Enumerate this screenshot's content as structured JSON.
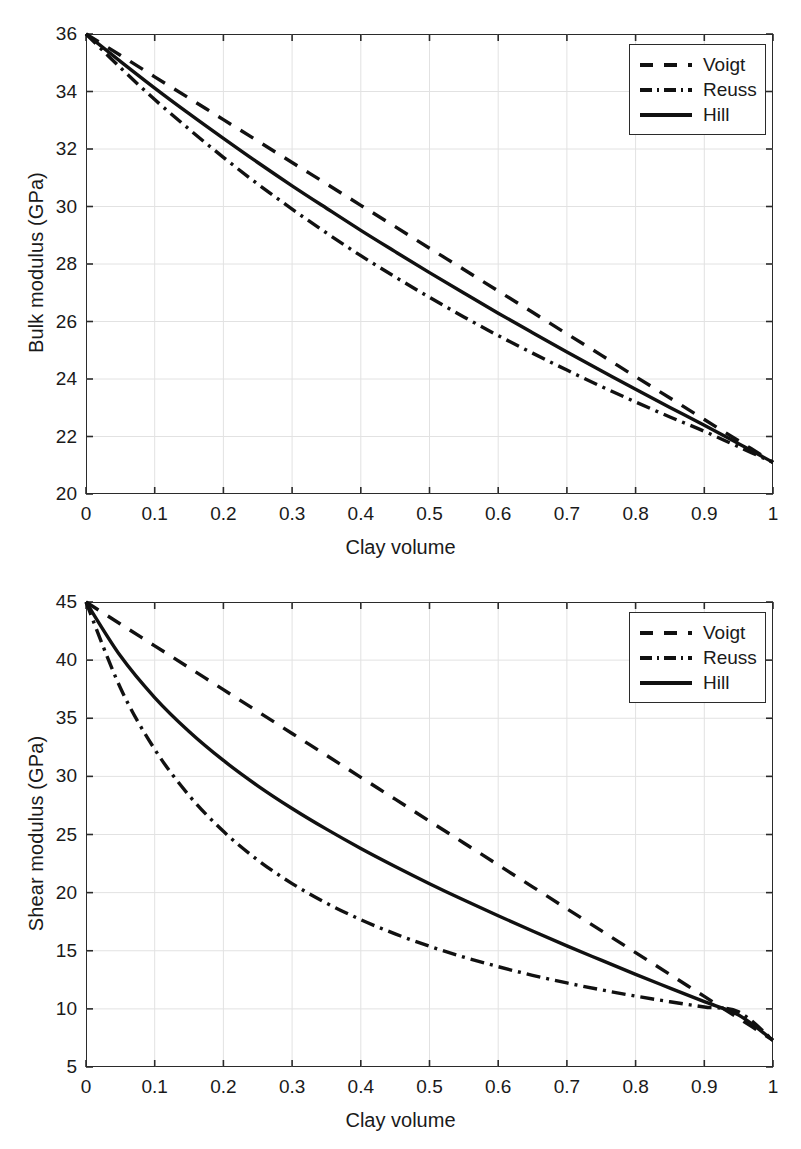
{
  "figure": {
    "width": 801,
    "height": 1149,
    "background": "#ffffff",
    "line_color": "#111111",
    "grid_color": "#e2e2e2",
    "axis_color": "#2b2b2b"
  },
  "chart_data": [
    {
      "type": "line",
      "id": "bulk-modulus-vs-clay-volume",
      "title": "",
      "xlabel": "Clay volume",
      "ylabel": "Bulk modulus (GPa)",
      "xlim": [
        0,
        1
      ],
      "ylim": [
        20,
        36
      ],
      "xticks": [
        0,
        0.1,
        0.2,
        0.3,
        0.4,
        0.5,
        0.6,
        0.7,
        0.8,
        0.9,
        1
      ],
      "xticklabels": [
        "0",
        "0.1",
        "0.2",
        "0.3",
        "0.4",
        "0.5",
        "0.6",
        "0.7",
        "0.8",
        "0.9",
        "1"
      ],
      "yticks": [
        20,
        22,
        24,
        26,
        28,
        30,
        32,
        34,
        36
      ],
      "yticklabels": [
        "20",
        "22",
        "24",
        "26",
        "28",
        "30",
        "32",
        "34",
        "36"
      ],
      "grid": true,
      "legend_position": "top-right",
      "endpoint_values": {
        "clay_volume_0": 36.0,
        "clay_volume_1": 21.1
      },
      "x": [
        0,
        0.05,
        0.1,
        0.15,
        0.2,
        0.25,
        0.3,
        0.35,
        0.4,
        0.45,
        0.5,
        0.55,
        0.6,
        0.65,
        0.7,
        0.75,
        0.8,
        0.85,
        0.9,
        0.95,
        1
      ],
      "series": [
        {
          "name": "Voigt",
          "style": "dashed",
          "values": [
            36.0,
            35.26,
            34.51,
            33.77,
            33.02,
            32.28,
            31.53,
            30.79,
            30.04,
            29.3,
            28.55,
            27.81,
            27.06,
            26.32,
            25.57,
            24.83,
            24.08,
            23.34,
            22.59,
            21.85,
            21.1
          ]
        },
        {
          "name": "Reuss",
          "style": "dash-dot",
          "values": [
            36.0,
            34.83,
            33.72,
            32.69,
            31.71,
            30.78,
            29.91,
            29.08,
            28.29,
            27.55,
            26.84,
            26.16,
            25.51,
            24.9,
            24.31,
            23.74,
            23.2,
            22.68,
            22.18,
            21.64,
            21.1
          ]
        },
        {
          "name": "Hill",
          "style": "solid",
          "values": [
            36.0,
            35.05,
            34.12,
            33.23,
            32.37,
            31.53,
            30.72,
            29.94,
            29.17,
            28.43,
            27.7,
            26.99,
            26.29,
            25.61,
            24.94,
            24.29,
            23.64,
            23.01,
            22.39,
            21.75,
            21.1
          ]
        }
      ]
    },
    {
      "type": "line",
      "id": "shear-modulus-vs-clay-volume",
      "title": "",
      "xlabel": "Clay volume",
      "ylabel": "Shear modulus (GPa)",
      "xlim": [
        0,
        1
      ],
      "ylim": [
        5,
        45
      ],
      "xticks": [
        0,
        0.1,
        0.2,
        0.3,
        0.4,
        0.5,
        0.6,
        0.7,
        0.8,
        0.9,
        1
      ],
      "xticklabels": [
        "0",
        "0.1",
        "0.2",
        "0.3",
        "0.4",
        "0.5",
        "0.6",
        "0.7",
        "0.8",
        "0.9",
        "1"
      ],
      "yticks": [
        5,
        10,
        15,
        20,
        25,
        30,
        35,
        40,
        45
      ],
      "yticklabels": [
        "5",
        "10",
        "15",
        "20",
        "25",
        "30",
        "35",
        "40",
        "45"
      ],
      "grid": true,
      "legend_position": "top-right",
      "endpoint_values": {
        "clay_volume_0": 45.0,
        "clay_volume_1": 7.3
      },
      "x": [
        0,
        0.05,
        0.1,
        0.15,
        0.2,
        0.25,
        0.3,
        0.35,
        0.4,
        0.45,
        0.5,
        0.55,
        0.6,
        0.65,
        0.7,
        0.75,
        0.8,
        0.85,
        0.9,
        0.95,
        1
      ],
      "series": [
        {
          "name": "Voigt",
          "style": "dashed",
          "values": [
            45.0,
            43.11,
            41.23,
            39.35,
            37.46,
            35.58,
            33.69,
            31.81,
            29.92,
            28.04,
            26.15,
            24.27,
            22.38,
            20.5,
            18.61,
            16.73,
            14.84,
            12.96,
            11.07,
            9.19,
            7.3
          ]
        },
        {
          "name": "Reuss",
          "style": "dash-dot",
          "values": [
            45.0,
            37.62,
            32.33,
            28.36,
            25.27,
            22.8,
            20.78,
            19.1,
            17.67,
            16.45,
            15.39,
            14.45,
            13.63,
            12.89,
            12.23,
            11.64,
            11.1,
            10.61,
            10.16,
            9.74,
            7.3
          ]
        },
        {
          "name": "Hill",
          "style": "solid",
          "values": [
            45.0,
            40.37,
            36.78,
            33.86,
            31.37,
            29.19,
            27.24,
            25.46,
            23.8,
            22.25,
            20.77,
            19.36,
            18.01,
            16.7,
            15.42,
            14.19,
            12.97,
            11.79,
            10.62,
            9.47,
            7.3
          ]
        }
      ]
    }
  ],
  "legend": {
    "items": [
      {
        "label": "Voigt",
        "style": "dashed"
      },
      {
        "label": "Reuss",
        "style": "dash-dot"
      },
      {
        "label": "Hill",
        "style": "solid"
      }
    ]
  }
}
